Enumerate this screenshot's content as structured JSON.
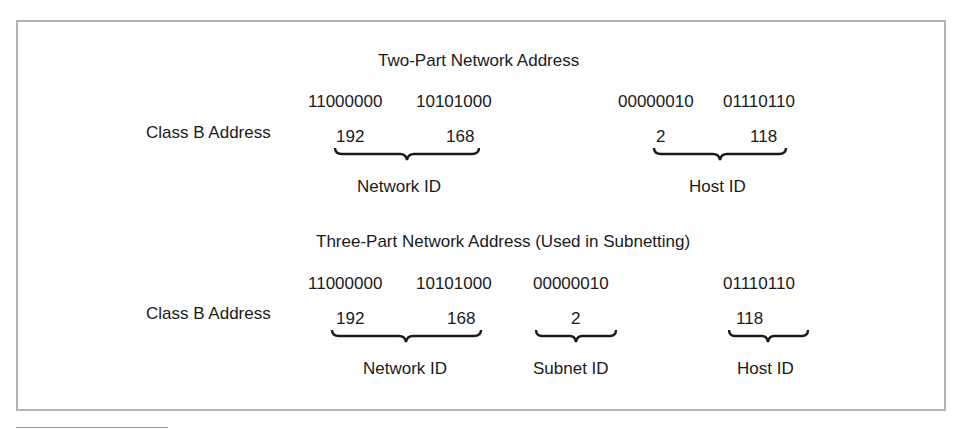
{
  "figure": {
    "two_part": {
      "title": "Two-Part Network Address",
      "row_label": "Class B Address",
      "octets_binary": [
        "11000000",
        "10101000",
        "00000010",
        "01110110"
      ],
      "octets_decimal": [
        "192",
        "168",
        "2",
        "118"
      ],
      "groups": [
        {
          "label": "Network ID",
          "octets": [
            "192",
            "168"
          ]
        },
        {
          "label": "Host ID",
          "octets": [
            "2",
            "118"
          ]
        }
      ]
    },
    "three_part": {
      "title": "Three-Part Network Address (Used in Subnetting)",
      "row_label": "Class B Address",
      "octets_binary": [
        "11000000",
        "10101000",
        "00000010",
        "01110110"
      ],
      "octets_decimal": [
        "192",
        "168",
        "2",
        "118"
      ],
      "groups": [
        {
          "label": "Network ID",
          "octets": [
            "192",
            "168"
          ]
        },
        {
          "label": "Subnet ID",
          "octets": [
            "2"
          ]
        },
        {
          "label": "Host ID",
          "octets": [
            "118"
          ]
        }
      ]
    }
  },
  "colors": {
    "text": "#1a1a1a",
    "frame_border": "#b3b3b3",
    "brace": "#1a1a1a"
  }
}
